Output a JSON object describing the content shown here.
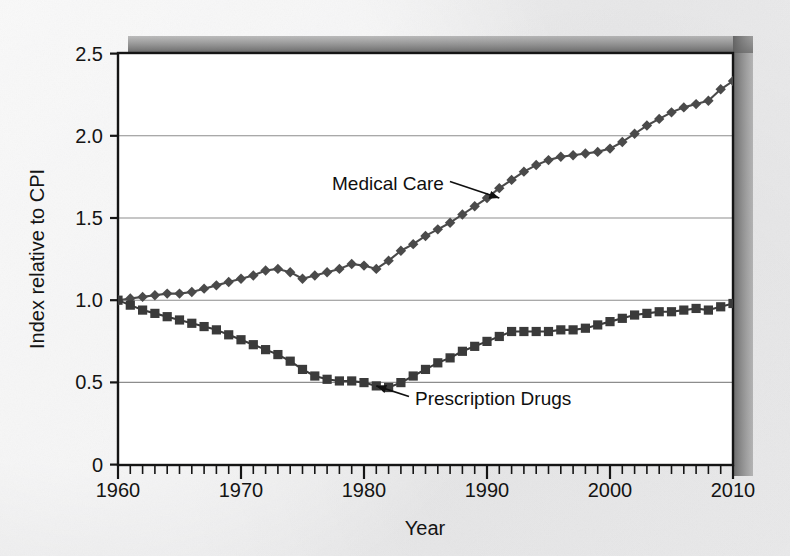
{
  "figure": {
    "background_color": "#ececec",
    "plot_background_color": "#ffffff",
    "frame_color": "#1a1a1a",
    "shadow_color": "#6e6e6e"
  },
  "chart_data": {
    "type": "line",
    "title": "",
    "xlabel": "Year",
    "ylabel": "Index relative to CPI",
    "xlim": [
      1960,
      2010
    ],
    "ylim": [
      0,
      2.5
    ],
    "xticks": [
      1960,
      1970,
      1980,
      1990,
      2000,
      2010
    ],
    "xtick_labels": [
      "1960",
      "1970",
      "1980",
      "1990",
      "2000",
      "2010"
    ],
    "xminor_tick_step": 1,
    "yticks": [
      0,
      0.5,
      1.0,
      1.5,
      2.0,
      2.5
    ],
    "ytick_labels": [
      "0",
      "0.5",
      "1.0",
      "1.5",
      "2.0",
      "2.5"
    ],
    "grid": "horizontal",
    "legend": "inline-annotations",
    "line_color": "#4a4a4a",
    "x": [
      1960,
      1961,
      1962,
      1963,
      1964,
      1965,
      1966,
      1967,
      1968,
      1969,
      1970,
      1971,
      1972,
      1973,
      1974,
      1975,
      1976,
      1977,
      1978,
      1979,
      1980,
      1981,
      1982,
      1983,
      1984,
      1985,
      1986,
      1987,
      1988,
      1989,
      1990,
      1991,
      1992,
      1993,
      1994,
      1995,
      1996,
      1997,
      1998,
      1999,
      2000,
      2001,
      2002,
      2003,
      2004,
      2005,
      2006,
      2007,
      2008,
      2009,
      2010
    ],
    "series": [
      {
        "name": "Medical Care",
        "marker": "diamond",
        "color": "#4a4a4a",
        "annotation": {
          "label": "Medical Care",
          "points_to_year": 1991,
          "points_to_value": 1.62
        },
        "values": [
          1.0,
          1.01,
          1.02,
          1.03,
          1.04,
          1.04,
          1.05,
          1.07,
          1.09,
          1.11,
          1.13,
          1.15,
          1.18,
          1.19,
          1.17,
          1.13,
          1.15,
          1.17,
          1.19,
          1.22,
          1.21,
          1.19,
          1.24,
          1.3,
          1.34,
          1.39,
          1.43,
          1.47,
          1.52,
          1.57,
          1.62,
          1.68,
          1.73,
          1.78,
          1.82,
          1.85,
          1.87,
          1.88,
          1.89,
          1.9,
          1.92,
          1.96,
          2.01,
          2.06,
          2.1,
          2.14,
          2.17,
          2.19,
          2.21,
          2.28,
          2.33
        ]
      },
      {
        "name": "Prescription Drugs",
        "marker": "square",
        "color": "#3a3a3a",
        "annotation": {
          "label": "Prescription Drugs",
          "points_to_year": 1981,
          "points_to_value": 0.48
        },
        "values": [
          1.0,
          0.97,
          0.94,
          0.92,
          0.9,
          0.88,
          0.86,
          0.84,
          0.82,
          0.79,
          0.76,
          0.73,
          0.7,
          0.67,
          0.63,
          0.58,
          0.54,
          0.52,
          0.51,
          0.51,
          0.5,
          0.48,
          0.47,
          0.5,
          0.54,
          0.58,
          0.62,
          0.65,
          0.69,
          0.72,
          0.75,
          0.78,
          0.81,
          0.81,
          0.81,
          0.81,
          0.82,
          0.82,
          0.83,
          0.85,
          0.87,
          0.89,
          0.91,
          0.92,
          0.93,
          0.93,
          0.94,
          0.95,
          0.94,
          0.96,
          0.98
        ]
      }
    ]
  }
}
